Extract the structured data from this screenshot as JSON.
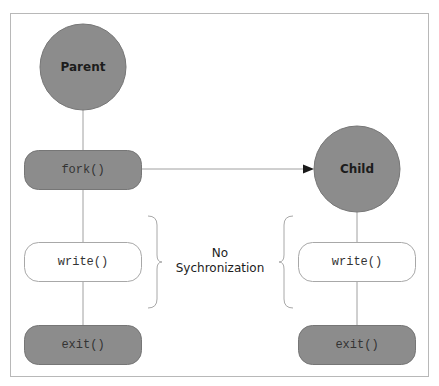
{
  "diagram": {
    "type": "process-flow",
    "colors": {
      "frame": "#b8b8b8",
      "node_fill": "#8c8c8c",
      "node_stroke": "#6e6e6e",
      "box_white_fill": "#ffffff",
      "box_white_stroke": "#a8a8a8",
      "connector": "#a0a0a0",
      "arrow": "#1a1a1a",
      "text": "#1c1c1c"
    },
    "parent": {
      "label": "Parent",
      "steps": [
        {
          "label": "fork()",
          "style": "filled"
        },
        {
          "label": "write()",
          "style": "outline"
        },
        {
          "label": "exit()",
          "style": "filled"
        }
      ]
    },
    "child": {
      "label": "Child",
      "steps": [
        {
          "label": "write()",
          "style": "outline"
        },
        {
          "label": "exit()",
          "style": "filled"
        }
      ]
    },
    "edges": [
      {
        "from": "fork()",
        "to": "Child",
        "type": "arrow"
      }
    ],
    "annotation": {
      "line1": "No",
      "line2": "Sychronization"
    }
  }
}
